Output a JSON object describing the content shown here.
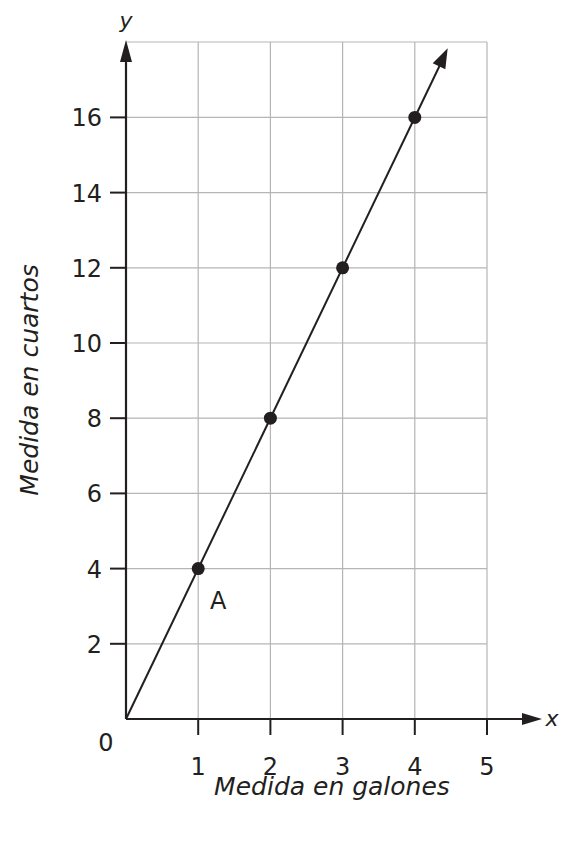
{
  "chart_data": {
    "type": "line",
    "title": "",
    "xlabel": "Medida en galones",
    "ylabel": "Medida en cuartos",
    "x_axis_variable": "x",
    "y_axis_variable": "y",
    "x_ticks": [
      "1",
      "2",
      "3",
      "4",
      "5"
    ],
    "y_ticks": [
      "2",
      "4",
      "6",
      "8",
      "10",
      "12",
      "14",
      "16"
    ],
    "origin_label": "0",
    "xlim": [
      0,
      5
    ],
    "ylim": [
      0,
      18
    ],
    "grid": true,
    "series": [
      {
        "name": "cuartos = 4 × galones",
        "x": [
          0,
          1,
          2,
          3,
          4
        ],
        "y": [
          0,
          4,
          8,
          12,
          16
        ],
        "markers": [
          [
            1,
            4
          ],
          [
            2,
            8
          ],
          [
            3,
            12
          ],
          [
            4,
            16
          ]
        ],
        "extends_with_arrow": true
      }
    ],
    "annotations": [
      {
        "text": "A",
        "x": 1,
        "y": 4
      }
    ]
  }
}
